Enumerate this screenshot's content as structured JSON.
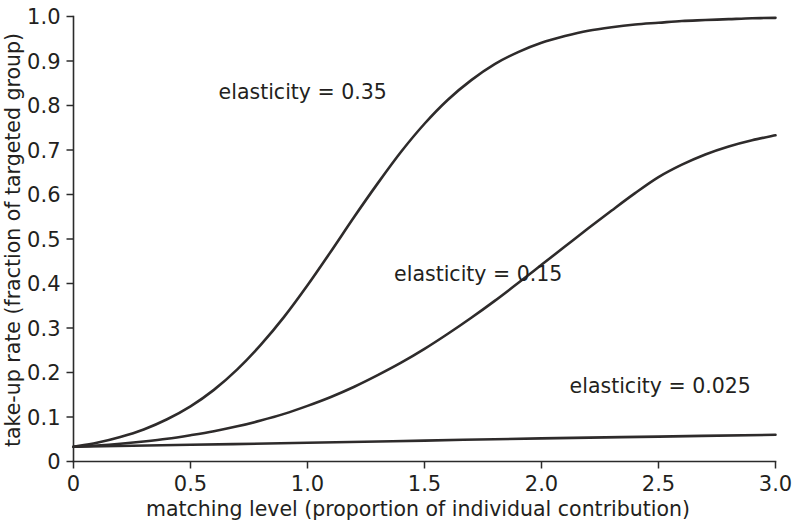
{
  "chart_data": {
    "type": "line",
    "title": "",
    "xlabel": "matching level (proportion of individual contribution)",
    "ylabel": "take-up rate (fraction of targeted group)",
    "xlim": [
      0,
      3.0
    ],
    "ylim": [
      0,
      1.0
    ],
    "grid": false,
    "legend_position": "inline-annotations",
    "x_ticks": [
      {
        "value": 0,
        "label": "0"
      },
      {
        "value": 0.5,
        "label": "0.5"
      },
      {
        "value": 1.0,
        "label": "1.0"
      },
      {
        "value": 1.5,
        "label": "1.5"
      },
      {
        "value": 2.0,
        "label": "2.0"
      },
      {
        "value": 2.5,
        "label": "2.5"
      },
      {
        "value": 3.0,
        "label": "3.0"
      }
    ],
    "y_ticks": [
      {
        "value": 0,
        "label": "0"
      },
      {
        "value": 0.1,
        "label": "0.1"
      },
      {
        "value": 0.2,
        "label": "0.2"
      },
      {
        "value": 0.3,
        "label": "0.3"
      },
      {
        "value": 0.4,
        "label": "0.4"
      },
      {
        "value": 0.5,
        "label": "0.5"
      },
      {
        "value": 0.6,
        "label": "0.6"
      },
      {
        "value": 0.7,
        "label": "0.7"
      },
      {
        "value": 0.8,
        "label": "0.8"
      },
      {
        "value": 0.9,
        "label": "0.9"
      },
      {
        "value": 1.0,
        "label": "1.0"
      }
    ],
    "line_color": "#2e2b2b",
    "series": [
      {
        "name": "elasticity = 0.35",
        "annotation": "elasticity = 0.35",
        "annotation_at": {
          "x": 0.62,
          "y": 0.815
        },
        "x": [
          0,
          0.1,
          0.2,
          0.3,
          0.4,
          0.5,
          0.6,
          0.7,
          0.8,
          0.9,
          1.0,
          1.1,
          1.2,
          1.3,
          1.4,
          1.5,
          1.6,
          1.7,
          1.8,
          1.9,
          2.0,
          2.1,
          2.2,
          2.3,
          2.4,
          2.5,
          2.6,
          2.7,
          2.8,
          2.9,
          3.0
        ],
        "values": [
          0.033,
          0.042,
          0.055,
          0.072,
          0.095,
          0.124,
          0.161,
          0.207,
          0.262,
          0.325,
          0.396,
          0.472,
          0.55,
          0.625,
          0.696,
          0.759,
          0.813,
          0.857,
          0.893,
          0.92,
          0.941,
          0.956,
          0.968,
          0.976,
          0.982,
          0.986,
          0.99,
          0.992,
          0.994,
          0.996,
          0.997
        ]
      },
      {
        "name": "elasticity = 0.15",
        "annotation": "elasticity = 0.15",
        "annotation_at": {
          "x": 1.37,
          "y": 0.405
        },
        "x": [
          0,
          0.1,
          0.2,
          0.3,
          0.4,
          0.5,
          0.6,
          0.7,
          0.8,
          0.9,
          1.0,
          1.1,
          1.2,
          1.3,
          1.4,
          1.5,
          1.6,
          1.7,
          1.8,
          1.9,
          2.0,
          2.1,
          2.2,
          2.3,
          2.4,
          2.5,
          2.6,
          2.7,
          2.8,
          2.9,
          3.0
        ],
        "values": [
          0.033,
          0.036,
          0.04,
          0.045,
          0.051,
          0.059,
          0.068,
          0.079,
          0.092,
          0.107,
          0.125,
          0.145,
          0.168,
          0.194,
          0.222,
          0.253,
          0.287,
          0.323,
          0.361,
          0.401,
          0.442,
          0.483,
          0.524,
          0.564,
          0.603,
          0.639,
          0.667,
          0.69,
          0.708,
          0.722,
          0.733
        ]
      },
      {
        "name": "elasticity = 0.025",
        "annotation": "elasticity = 0.025",
        "annotation_at": {
          "x": 2.12,
          "y": 0.155
        },
        "x": [
          0,
          0.5,
          1.0,
          1.5,
          2.0,
          2.5,
          3.0
        ],
        "values": [
          0.033,
          0.0375,
          0.042,
          0.047,
          0.052,
          0.056,
          0.06
        ]
      }
    ]
  },
  "figure": {
    "background": "#ffffff"
  }
}
